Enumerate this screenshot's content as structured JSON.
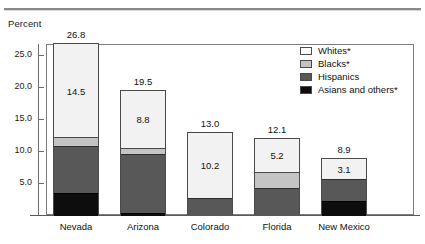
{
  "header": {
    "rule": true
  },
  "axis": {
    "ylabel": "Percent",
    "yticks": [
      "5.0",
      "10.0",
      "15.0",
      "20.0",
      "25.0"
    ]
  },
  "legend": {
    "items": [
      {
        "label": "Whites*",
        "color": "#ffffff",
        "key": "whites"
      },
      {
        "label": "Blacks*",
        "color": "#c4c4c4",
        "key": "blacks"
      },
      {
        "label": "Hispanics",
        "color": "#585858",
        "key": "hispanics"
      },
      {
        "label": "Asians and others*",
        "color": "#0d0d0d",
        "key": "asians"
      }
    ]
  },
  "chart_data": {
    "type": "bar",
    "subtype": "stacked",
    "title": "",
    "xlabel": "",
    "ylabel": "Percent",
    "ylim": [
      0,
      27.5
    ],
    "yticks": [
      5.0,
      10.0,
      15.0,
      20.0,
      25.0
    ],
    "grid": false,
    "legend_position": "top-right",
    "categories": [
      "Nevada",
      "Arizona",
      "Colorado",
      "Florida",
      "New Mexico"
    ],
    "totals": [
      "26.8",
      "19.5",
      "13.0",
      "12.1",
      "8.9"
    ],
    "totals_numeric": [
      26.8,
      19.5,
      13.0,
      12.1,
      8.9
    ],
    "series": [
      {
        "name": "Whites*",
        "color": "#f2f2f2",
        "values": [
          14.5,
          8.8,
          10.2,
          5.2,
          3.1
        ],
        "labels": [
          "14.5",
          "8.8",
          "10.2",
          "5.2",
          "3.1"
        ]
      },
      {
        "name": "Blacks*",
        "color": "#c4c4c4",
        "values": [
          1.4,
          1.0,
          0.0,
          2.5,
          0.0
        ],
        "labels": [
          "",
          "",
          "",
          "",
          ""
        ]
      },
      {
        "name": "Hispanics",
        "color": "#585858",
        "values": [
          7.3,
          9.2,
          2.8,
          4.4,
          3.5
        ],
        "labels": [
          "",
          "",
          "",
          "",
          ""
        ]
      },
      {
        "name": "Asians and others*",
        "color": "#0d0d0d",
        "values": [
          3.6,
          0.5,
          0.0,
          0.0,
          2.3
        ],
        "labels": [
          "",
          "",
          "",
          "",
          ""
        ]
      }
    ]
  }
}
